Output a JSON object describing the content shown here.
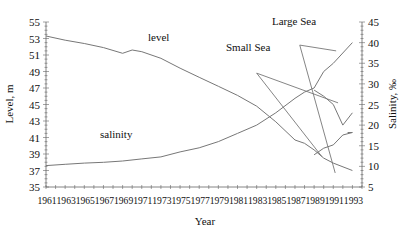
{
  "chart_data": {
    "type": "line",
    "title": "",
    "xlabel": "Year",
    "ylabel": "Level, m",
    "ylabel_right": "Salinity, ‰",
    "xlim": [
      1961,
      1994
    ],
    "ylim": [
      35,
      55
    ],
    "ylim_right": [
      5,
      45
    ],
    "x_ticks": [
      "1961",
      "1963",
      "1965",
      "1967",
      "1969",
      "1971",
      "1973",
      "1975",
      "1977",
      "1979",
      "1981",
      "1983",
      "1985",
      "1987",
      "1989",
      "1991",
      "1993"
    ],
    "y_ticks": [
      35,
      37,
      39,
      41,
      43,
      45,
      47,
      49,
      51,
      53,
      55
    ],
    "y_ticks_right": [
      5,
      10,
      15,
      20,
      25,
      30,
      35,
      40,
      45
    ],
    "grid": false,
    "annotations": [
      {
        "text": "level",
        "x": 1970.5,
        "y": 52.6
      },
      {
        "text": "salinity",
        "x": 1966,
        "y": 40.7
      },
      {
        "text": "Small Sea",
        "x": 1983,
        "y": 49.8
      },
      {
        "text": "Large Sea",
        "x": 1988,
        "y": 54.1
      }
    ],
    "series": [
      {
        "name": "level",
        "axis": "left",
        "x": [
          1961,
          1963,
          1965,
          1967,
          1969,
          1970,
          1971,
          1973,
          1975,
          1977,
          1979,
          1981,
          1983,
          1985,
          1987,
          1988,
          1989,
          1990,
          1991,
          1993
        ],
        "values": [
          53.3,
          52.8,
          52.4,
          51.9,
          51.2,
          51.6,
          51.4,
          50.6,
          49.4,
          48.3,
          47.2,
          46.1,
          44.8,
          42.9,
          40.7,
          40.3,
          39.5,
          38.5,
          37.9,
          37.0
        ]
      },
      {
        "name": "salinity",
        "axis": "right",
        "x": [
          1961,
          1963,
          1965,
          1967,
          1969,
          1971,
          1973,
          1975,
          1977,
          1979,
          1981,
          1983,
          1985,
          1987,
          1988,
          1989,
          1990,
          1991,
          1993
        ],
        "values": [
          10.2,
          10.5,
          10.8,
          11,
          11.3,
          11.8,
          12.3,
          13.5,
          14.5,
          16,
          18,
          20,
          23,
          26.5,
          28,
          29,
          33,
          35,
          40
        ]
      },
      {
        "name": "salinity Small Sea",
        "axis": "right",
        "x": [
          1989,
          1990,
          1991,
          1992,
          1993
        ],
        "values": [
          28.5,
          27,
          25,
          20,
          23
        ]
      },
      {
        "name": "level Large Sea",
        "axis": "left",
        "x": [
          1989,
          1990,
          1991,
          1992,
          1993
        ],
        "values": [
          38.9,
          39.7,
          40.1,
          41.3,
          41.6
        ]
      },
      {
        "name": "level Small Sea",
        "axis": "left",
        "x": [
          1992.5,
          1993
        ],
        "values": [
          41.6,
          41.6
        ]
      }
    ],
    "leader_lines": [
      {
        "label": "Small Sea",
        "from": [
          1983,
          48.8
        ],
        "to": [
          1991.5,
          45.2
        ]
      },
      {
        "label": "Small Sea",
        "from": [
          1983,
          48.8
        ],
        "to": [
          1989.8,
          38.7
        ]
      },
      {
        "label": "Large Sea",
        "from": [
          1987.5,
          52.2
        ],
        "to": [
          1991.3,
          51.5
        ]
      },
      {
        "label": "Large Sea",
        "from": [
          1987.5,
          52.2
        ],
        "to": [
          1991.2,
          36.7
        ]
      }
    ]
  },
  "labels": {
    "xlabel": "Year",
    "ylabel": "Level, m",
    "ylabel_right": "Salinity, ‰",
    "level": "level",
    "salinity": "salinity",
    "small_sea": "Small Sea",
    "large_sea": "Large Sea"
  }
}
